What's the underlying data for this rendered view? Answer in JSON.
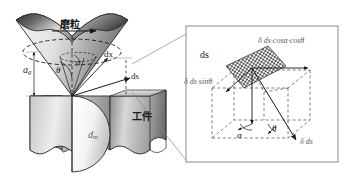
{
  "figure": {
    "type": "technical-diagram",
    "background_color": "#ffffff",
    "line_color": "#1a1a1a",
    "panels": [
      {
        "id": "left-panel",
        "name": "grain-workpiece-view",
        "description": "Inverted conical abrasive grain engaging a workpiece"
      },
      {
        "id": "right-panel",
        "name": "magnified-vector-cube",
        "description": "Magnified cube showing decomposition of the element ds",
        "border_color": "#8a8a8a"
      }
    ]
  },
  "left_panel": {
    "grain_label": "磨粒",
    "workpiece_label": "工件",
    "depth_label": "a",
    "depth_sub": "g",
    "diameter_label": "d",
    "diameter_sub": "m",
    "angle_theta": "θ",
    "angle_alpha": "α",
    "dx_label": "dx",
    "ds_label": "ds",
    "grain_fill_dark": "#3a3a3a",
    "grain_fill_light": "#f0f0f0",
    "workpiece_fill_dark": "#6e6e6e",
    "workpiece_fill_light": "#ededed"
  },
  "right_panel": {
    "ds_label": "ds",
    "component_cos": "δ ds·cosα·cosθ",
    "component_sin": "δ ds·sinθ",
    "component_delta": "δ ds",
    "angle_alpha": "α",
    "angle_theta": "θ",
    "patch_pattern": "checkerboard",
    "patch_color": "#5a5a5a",
    "dashed_color": "#4a4a4a"
  }
}
